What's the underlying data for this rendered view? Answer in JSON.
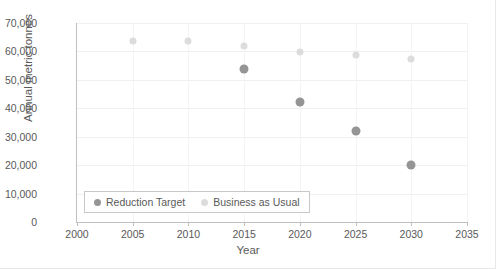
{
  "chart_data": {
    "type": "scatter",
    "title": "",
    "xlabel": "Year",
    "ylabel": "Annual metric tonnes",
    "xlim": [
      2000,
      2035
    ],
    "ylim": [
      0,
      70000
    ],
    "xticks": [
      "2000",
      "2005",
      "2010",
      "2015",
      "2020",
      "2025",
      "2030",
      "2035"
    ],
    "xtick_values": [
      2000,
      2005,
      2010,
      2015,
      2020,
      2025,
      2030,
      2035
    ],
    "yticks": [
      "0",
      "10,000",
      "20,000",
      "30,000",
      "40,000",
      "50,000",
      "60,000",
      "70,000"
    ],
    "ytick_values": [
      0,
      10000,
      20000,
      30000,
      40000,
      50000,
      60000,
      70000
    ],
    "grid": true,
    "legend_position": "bottom-left",
    "series": [
      {
        "name": "Reduction Target",
        "color": "#959595",
        "x": [
          2015,
          2020,
          2025,
          2030
        ],
        "values": [
          53700,
          42200,
          32000,
          20000
        ]
      },
      {
        "name": "Business as Usual",
        "color": "#dcdcdc",
        "x": [
          2005,
          2010,
          2015,
          2020,
          2025,
          2030
        ],
        "values": [
          63600,
          63600,
          61800,
          59900,
          58600,
          57500
        ]
      }
    ]
  },
  "legend": {
    "items": [
      {
        "label": "Reduction Target",
        "color": "#959595"
      },
      {
        "label": "Business as Usual",
        "color": "#dcdcdc"
      }
    ]
  }
}
